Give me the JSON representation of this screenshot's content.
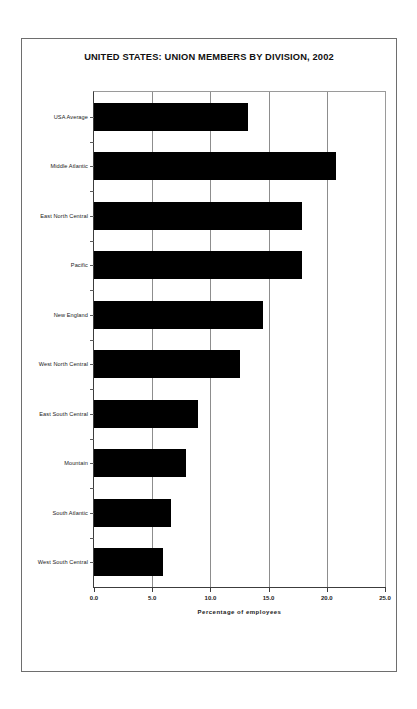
{
  "chart_data": {
    "type": "bar",
    "orientation": "horizontal",
    "title": "UNITED STATES: UNION MEMBERS BY DIVISION, 2002",
    "xlabel": "Percentage of employees",
    "ylabel": "",
    "xlim": [
      0.0,
      25.0
    ],
    "xticks": [
      0.0,
      5.0,
      10.0,
      15.0,
      20.0,
      25.0
    ],
    "xtick_labels": [
      "0.0",
      "5.0",
      "10.0",
      "15.0",
      "20.0",
      "25.0"
    ],
    "grid": true,
    "grid_axis": "x",
    "legend": null,
    "bar_color": "#000000",
    "background_color": "#ffffff",
    "categories": [
      "USA Average",
      "Middle Atlantic",
      "East North Central",
      "Pacific",
      "New England",
      "West North Central",
      "East South Central",
      "Mountain",
      "South Atlantic",
      "West South Central"
    ],
    "values": [
      13.2,
      20.8,
      17.9,
      17.9,
      14.5,
      12.5,
      8.9,
      7.9,
      6.6,
      5.9
    ]
  }
}
